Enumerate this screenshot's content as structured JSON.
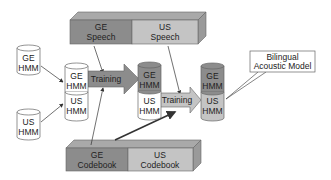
{
  "diagram": {
    "title": "",
    "colors": {
      "dark_gray": "#8c8c8c",
      "light_gray": "#c4c4c4",
      "white": "#ffffff",
      "stroke": "#555555"
    },
    "nodes": {
      "ge_hmm_input": {
        "line1": "GE",
        "line2": "HMM"
      },
      "us_hmm_input": {
        "line1": "US",
        "line2": "HMM"
      },
      "stack1": {
        "top1": "GE",
        "top2": "HMM",
        "bot1": "US",
        "bot2": "HMM"
      },
      "stack2": {
        "top1": "GE",
        "top2": "HMM",
        "bot1": "US",
        "bot2": "HMM"
      },
      "stack3": {
        "top1": "GE",
        "top2": "HMM",
        "bot1": "US",
        "bot2": "HMM"
      },
      "ge_speech": {
        "line1": "GE",
        "line2": "Speech"
      },
      "us_speech": {
        "line1": "US",
        "line2": "Speech"
      },
      "ge_codebook": {
        "line1": "GE",
        "line2": "Codebook"
      },
      "us_codebook": {
        "line1": "US",
        "line2": "Codebook"
      },
      "training1": {
        "label": "Training"
      },
      "training2": {
        "label": "Training"
      },
      "bilingual": {
        "line1": "Bilingual",
        "line2": "Acoustic Model"
      }
    }
  }
}
